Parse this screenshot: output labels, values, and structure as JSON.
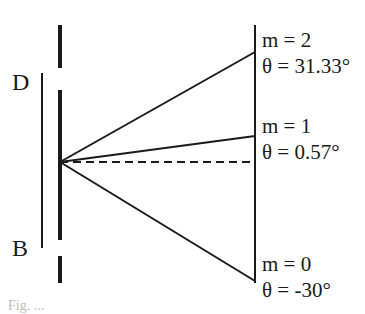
{
  "plate_labels": {
    "top": "D",
    "bottom": "B"
  },
  "orders": [
    {
      "m_label": "m = 2",
      "theta_label": "θ = 31.33°"
    },
    {
      "m_label": "m = 1",
      "theta_label": "θ = 0.57°"
    },
    {
      "m_label": "m = 0",
      "theta_label": "θ = -30°"
    }
  ],
  "caption_fragment": "Fig. ...",
  "colors": {
    "ink": "#1a1a1a",
    "background": "#ffffff"
  }
}
